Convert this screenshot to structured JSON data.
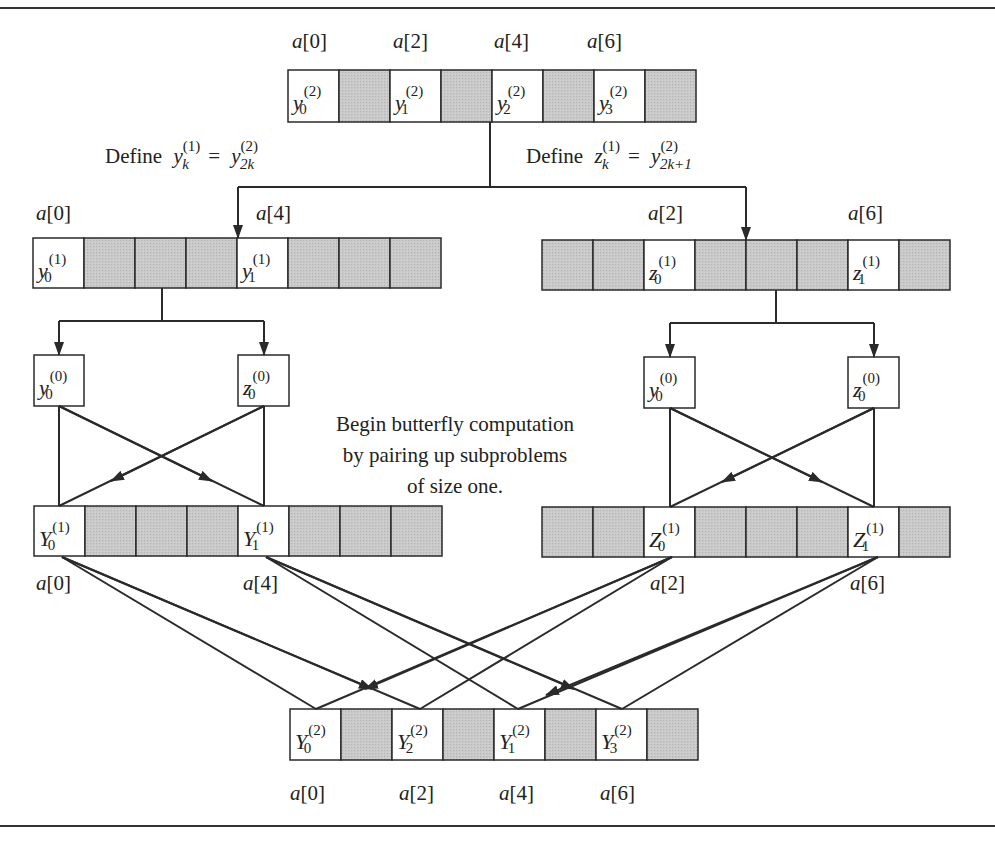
{
  "colors": {
    "shaded_cell": "#c4c4c4",
    "empty_cell": "#ffffff",
    "stroke": "#2a2a2a",
    "text": "#222222"
  },
  "top_array": {
    "index_labels": [
      "a[0]",
      "a[2]",
      "a[4]",
      "a[6]"
    ],
    "cells": [
      {
        "base": "y",
        "sub": "0",
        "sup": "(2)",
        "shaded": false
      },
      {
        "shaded": true
      },
      {
        "base": "y",
        "sub": "1",
        "sup": "(2)",
        "shaded": false
      },
      {
        "shaded": true
      },
      {
        "base": "y",
        "sub": "2",
        "sup": "(2)",
        "shaded": false
      },
      {
        "shaded": true
      },
      {
        "base": "y",
        "sub": "3",
        "sup": "(2)",
        "shaded": false
      },
      {
        "shaded": true
      }
    ]
  },
  "definitions": {
    "left": {
      "prefix": "Define",
      "lhs_base": "y",
      "lhs_sub": "k",
      "lhs_sup": "(1)",
      "eq": "=",
      "rhs_base": "y",
      "rhs_sub": "2k",
      "rhs_sup": "(2)"
    },
    "right": {
      "prefix": "Define",
      "lhs_base": "z",
      "lhs_sub": "k",
      "lhs_sup": "(1)",
      "eq": "=",
      "rhs_base": "y",
      "rhs_sub": "2k+1",
      "rhs_sup": "(2)"
    }
  },
  "level1_left": {
    "index_labels": [
      "a[0]",
      "a[4]"
    ],
    "cells": [
      {
        "base": "y",
        "sub": "0",
        "sup": "(1)"
      },
      {},
      {},
      {},
      {
        "base": "y",
        "sub": "1",
        "sup": "(1)"
      },
      {},
      {},
      {}
    ]
  },
  "level1_right": {
    "index_labels": [
      "a[2]",
      "a[6]"
    ],
    "cells": [
      {},
      {},
      {
        "base": "z",
        "sub": "0",
        "sup": "(1)"
      },
      {},
      {},
      {},
      {
        "base": "z",
        "sub": "1",
        "sup": "(1)"
      },
      {}
    ]
  },
  "level0_left": {
    "y_box": {
      "base": "y",
      "sub": "0",
      "sup": "(0)"
    },
    "z_box": {
      "base": "z",
      "sub": "0",
      "sup": "(0)"
    }
  },
  "level0_right": {
    "y_box": {
      "base": "y",
      "sub": "0",
      "sup": "(0)"
    },
    "z_box": {
      "base": "z",
      "sub": "0",
      "sup": "(0)"
    }
  },
  "annotation": {
    "lines": [
      "Begin butterfly computation",
      "by pairing up subproblems",
      "of size one."
    ]
  },
  "result1_left": {
    "index_labels": [
      "a[0]",
      "a[4]"
    ],
    "cells": [
      {
        "base": "Y",
        "sub": "0",
        "sup": "(1)"
      },
      {},
      {},
      {},
      {
        "base": "Y",
        "sub": "1",
        "sup": "(1)"
      },
      {},
      {},
      {}
    ]
  },
  "result1_right": {
    "index_labels": [
      "a[2]",
      "a[6]"
    ],
    "cells": [
      {},
      {},
      {
        "base": "Z",
        "sub": "0",
        "sup": "(1)"
      },
      {},
      {},
      {},
      {
        "base": "Z",
        "sub": "1",
        "sup": "(1)"
      },
      {}
    ]
  },
  "result2": {
    "index_labels": [
      "a[0]",
      "a[2]",
      "a[4]",
      "a[6]"
    ],
    "cells": [
      {
        "base": "Y",
        "sub": "0",
        "sup": "(2)"
      },
      {},
      {
        "base": "Y",
        "sub": "2",
        "sup": "(2)"
      },
      {},
      {
        "base": "Y",
        "sub": "1",
        "sup": "(2)"
      },
      {},
      {
        "base": "Y",
        "sub": "3",
        "sup": "(2)"
      },
      {}
    ]
  }
}
